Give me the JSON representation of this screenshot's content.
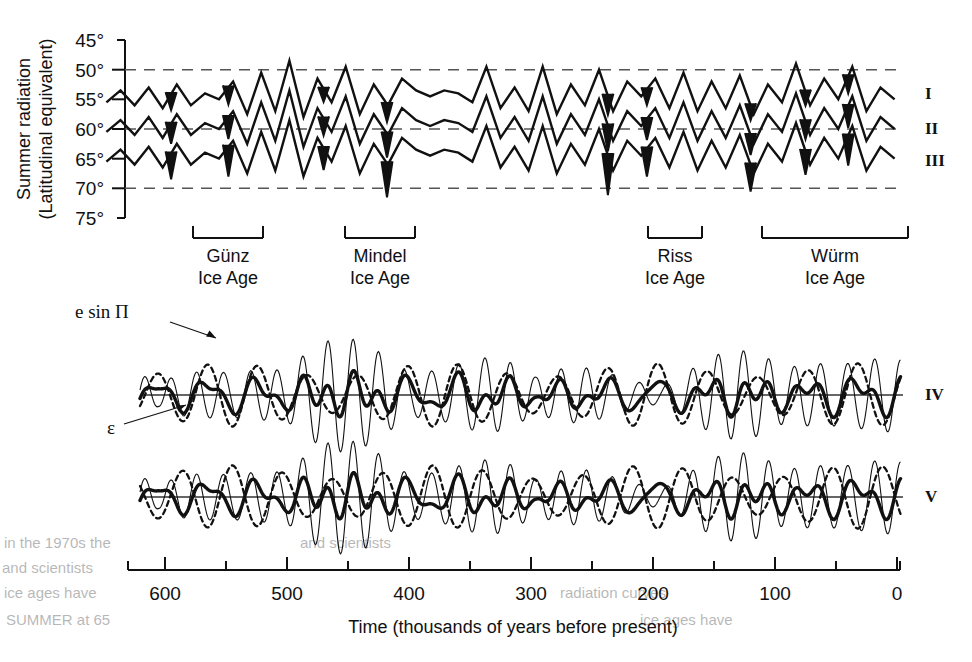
{
  "figure": {
    "y_axis": {
      "label_line1": "Summer radiation",
      "label_line2": "(Latitudinal equivalent)",
      "ticks": [
        "45°",
        "50°",
        "55°",
        "60°",
        "65°",
        "70°",
        "75°"
      ],
      "gridlines": [
        "50°",
        "60°",
        "70°"
      ]
    },
    "x_axis": {
      "label": "Time (thousands of years before present)",
      "ticks": [
        "600",
        "500",
        "400",
        "300",
        "200",
        "100",
        "0"
      ]
    },
    "curve_labels": {
      "top_panel": [
        "I",
        "II",
        "III"
      ],
      "bottom_panels": [
        "IV",
        "V"
      ]
    },
    "annotations": [
      {
        "name": "precession",
        "text": "e sin Π"
      },
      {
        "name": "obliquity",
        "text": "ε"
      }
    ],
    "ice_ages": [
      {
        "name": "Günz",
        "sub": "Ice Age"
      },
      {
        "name": "Mindel",
        "sub": "Ice Age"
      },
      {
        "name": "Riss",
        "sub": "Ice Age"
      },
      {
        "name": "Würm",
        "sub": "Ice Age"
      }
    ],
    "bleed_text": [
      "in the 1970s the",
      "and scientists",
      "ice ages have",
      "SUMMER at 65",
      "radiation curves"
    ]
  },
  "chart_data": {
    "type": "line",
    "title": "",
    "xlabel": "Time (thousands of years before present)",
    "ylabel": "Summer radiation (Latitudinal equivalent)",
    "xlim": [
      650,
      0
    ],
    "xticks": [
      600,
      500,
      400,
      300,
      200,
      100,
      0
    ],
    "xminor_step": 50,
    "panels": [
      {
        "name": "top-radiation-panel",
        "ylim": [
          75,
          45
        ],
        "yticks": [
          45,
          50,
          55,
          60,
          65,
          70,
          75
        ],
        "gridlines": [
          50,
          60,
          70
        ],
        "series": [
          {
            "name": "I",
            "offset": 0,
            "values": [
              55.5,
              53.5,
              56.0,
              53.0,
              56.5,
              52.5,
              56.0,
              54.0,
              55.0,
              52.0,
              57.5,
              50.5,
              57.0,
              48.5,
              58.0,
              51.5,
              55.5,
              49.5,
              57.5,
              52.5,
              56.0,
              51.5,
              53.5,
              54.5,
              53.5,
              54.0,
              55.5,
              49.5,
              56.5,
              53.0,
              57.0,
              49.5,
              57.5,
              52.5,
              56.0,
              50.0,
              57.0,
              52.0,
              54.5,
              51.5,
              56.5,
              50.5,
              57.0,
              52.0,
              56.5,
              51.0,
              57.5,
              52.5,
              55.5,
              49.0,
              56.0,
              51.5,
              55.0,
              49.5,
              57.0,
              53.0,
              55.0
            ]
          },
          {
            "name": "II",
            "offset": 5,
            "values": [
              55.5,
              53.5,
              56.0,
              53.0,
              56.5,
              52.5,
              56.0,
              54.0,
              55.0,
              52.0,
              57.5,
              50.5,
              57.0,
              48.5,
              58.0,
              51.5,
              55.5,
              49.5,
              57.5,
              52.5,
              56.0,
              51.5,
              53.5,
              54.5,
              53.5,
              54.0,
              55.5,
              49.5,
              56.5,
              53.0,
              57.0,
              49.5,
              57.5,
              52.5,
              56.0,
              50.0,
              57.0,
              52.0,
              54.5,
              51.5,
              56.5,
              50.5,
              57.0,
              52.0,
              56.5,
              51.0,
              57.5,
              52.5,
              55.5,
              49.0,
              56.0,
              51.5,
              55.0,
              49.5,
              57.0,
              53.0,
              55.0
            ]
          },
          {
            "name": "III",
            "offset": 10,
            "values": [
              55.5,
              53.5,
              56.0,
              53.0,
              56.5,
              52.5,
              56.0,
              54.0,
              55.0,
              52.0,
              57.5,
              50.5,
              57.0,
              48.5,
              58.0,
              51.5,
              55.5,
              49.5,
              57.5,
              52.5,
              56.0,
              51.5,
              53.5,
              54.5,
              53.5,
              54.0,
              55.5,
              49.5,
              56.5,
              53.0,
              57.0,
              49.5,
              57.5,
              52.5,
              56.0,
              50.0,
              57.0,
              52.0,
              54.5,
              51.5,
              56.5,
              50.5,
              57.0,
              52.0,
              56.5,
              51.0,
              57.5,
              52.5,
              55.5,
              49.0,
              56.0,
              51.5,
              55.0,
              49.5,
              57.0,
              53.0,
              55.0
            ]
          }
        ],
        "glacial_fills_ka": [
          595,
          548,
          470,
          418,
          237,
          205,
          120,
          75,
          40
        ]
      },
      {
        "name": "panel-IV",
        "label": "IV",
        "baseline": 0,
        "series": [
          {
            "name": "e sin Π",
            "style": "thin",
            "period_ka": 21,
            "amplitude": 1.0
          },
          {
            "name": "ε",
            "style": "dotted",
            "period_ka": 41,
            "amplitude": 0.62
          },
          {
            "name": "combined",
            "style": "bold",
            "period_ka": 0,
            "amplitude": 0.7
          }
        ]
      },
      {
        "name": "panel-V",
        "label": "V",
        "baseline": 0,
        "series": [
          {
            "name": "e sin Π",
            "style": "thin",
            "period_ka": 21,
            "amplitude": 1.0
          },
          {
            "name": "ε",
            "style": "dotted",
            "period_ka": 41,
            "amplitude": 0.62,
            "phase_inverted": true
          },
          {
            "name": "combined",
            "style": "bold",
            "period_ka": 0,
            "amplitude": 0.7
          }
        ]
      }
    ],
    "ice_age_spans_ka": [
      {
        "label": "Günz",
        "start": 590,
        "end": 535
      },
      {
        "label": "Mindel",
        "start": 470,
        "end": 415
      },
      {
        "label": "Riss",
        "start": 240,
        "end": 197
      },
      {
        "label": "Würm",
        "start": 147,
        "end": 32
      }
    ]
  }
}
